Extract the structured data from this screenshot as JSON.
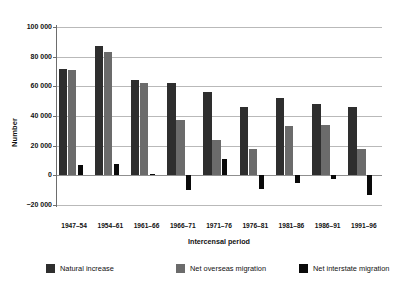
{
  "chart_data": {
    "type": "bar",
    "title": "",
    "subtitle": "",
    "xlabel": "Intercensal period",
    "ylabel": "Number",
    "grid": true,
    "legend_position": "bottom",
    "ylim": [
      -20000,
      100000
    ],
    "ytick_step": 20000,
    "ytick_labels": [
      "100 000",
      "80 000",
      "60 000",
      "40 000",
      "20 000",
      "0",
      "−20 000"
    ],
    "ytick_values": [
      100000,
      80000,
      60000,
      40000,
      20000,
      0,
      -20000
    ],
    "categories": [
      "1947–54",
      "1954–61",
      "1961–66",
      "1966–71",
      "1971–76",
      "1976–81",
      "1981–86",
      "1986–91",
      "1991–96"
    ],
    "series": [
      {
        "name": "Natural increase",
        "color": "#2e2e2e",
        "values": [
          72000,
          87000,
          64000,
          62000,
          56000,
          46000,
          52000,
          48000,
          46000
        ]
      },
      {
        "name": "Net overseas migration",
        "color": "#6b6b6b",
        "values": [
          71000,
          83000,
          62000,
          37000,
          24000,
          18000,
          33000,
          34000,
          18000
        ]
      },
      {
        "name": "Net interstate migration",
        "color": "#0a0a0a",
        "values": [
          7000,
          7500,
          1000,
          -10000,
          11000,
          -9500,
          -5500,
          -2500,
          -13500
        ]
      }
    ]
  },
  "legend": {
    "items": [
      {
        "label": "Natural increase",
        "color": "#2e2e2e"
      },
      {
        "label": "Net overseas migration",
        "color": "#6b6b6b"
      },
      {
        "label": "Net interstate migration",
        "color": "#0a0a0a"
      }
    ]
  },
  "axes": {
    "y_title": "Number",
    "x_title": "Intercensal period"
  }
}
